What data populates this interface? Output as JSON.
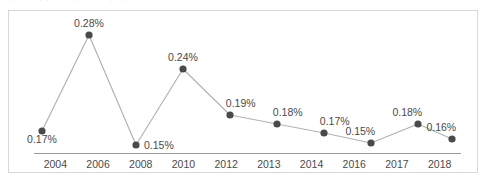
{
  "top_clip": {
    "text": "· — ·· — · –– · · —— – –"
  },
  "chart_data": {
    "type": "line",
    "title": "",
    "subtitle": "",
    "xlabel": "",
    "ylabel": "",
    "grid": false,
    "legend": null,
    "axis_color": "#9a9a9a",
    "line_color": "#b3b3b3",
    "marker_color": "#4a4a4a",
    "label_color": "#4a4a4a",
    "border_color": "#d8d8d8",
    "background": "#ffffff",
    "ylim": [
      0.13,
      0.3
    ],
    "categories": [
      "2004",
      "2006",
      "2008",
      "2010",
      "2012",
      "2013",
      "2014",
      "2016",
      "2017",
      "2018"
    ],
    "values": [
      0.17,
      0.28,
      0.15,
      0.24,
      0.19,
      0.18,
      0.17,
      0.15,
      0.18,
      0.16
    ],
    "value_labels": [
      "0.17%",
      "0.28%",
      "0.15%",
      "0.24%",
      "0.19%",
      "0.18%",
      "0.17%",
      "0.15%",
      "0.18%",
      "0.16%"
    ],
    "points": [
      {
        "category": "2004",
        "value": 0.17,
        "label": "0.17%",
        "x": 33,
        "y": 120,
        "label_pos": "below"
      },
      {
        "category": "2006",
        "value": 0.28,
        "label": "0.28%",
        "x": 80,
        "y": 24,
        "label_pos": "above-center"
      },
      {
        "category": "2008",
        "value": 0.15,
        "label": "0.15%",
        "x": 127,
        "y": 134,
        "label_pos": "right"
      },
      {
        "category": "2010",
        "value": 0.24,
        "label": "0.24%",
        "x": 174,
        "y": 58,
        "label_pos": "above-center"
      },
      {
        "category": "2012",
        "value": 0.19,
        "label": "0.19%",
        "x": 221,
        "y": 104,
        "label_pos": "above-right"
      },
      {
        "category": "2013",
        "value": 0.18,
        "label": "0.18%",
        "x": 268,
        "y": 113,
        "label_pos": "above-right"
      },
      {
        "category": "2014",
        "value": 0.17,
        "label": "0.17%",
        "x": 315,
        "y": 122,
        "label_pos": "above-right"
      },
      {
        "category": "2016",
        "value": 0.15,
        "label": "0.15%",
        "x": 362,
        "y": 132,
        "label_pos": "above-left"
      },
      {
        "category": "2017",
        "value": 0.18,
        "label": "0.18%",
        "x": 409,
        "y": 113,
        "label_pos": "above-left"
      },
      {
        "category": "2018",
        "value": 0.16,
        "label": "0.16%",
        "x": 443,
        "y": 128,
        "label_pos": "above-left"
      }
    ]
  }
}
